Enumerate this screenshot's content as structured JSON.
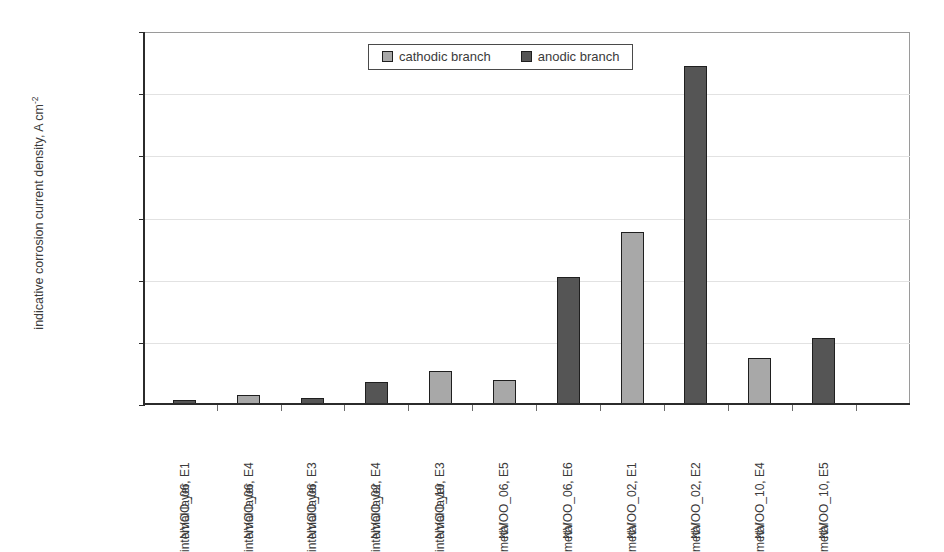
{
  "top_remnant": "clipped caption text above figure",
  "chart_data": {
    "type": "bar",
    "title": "",
    "xlabel": "",
    "ylabel": "indicative corrosion current density, A cm",
    "ylabel_exponent": "-2",
    "ylim": [
      0,
      0.00012
    ],
    "ytick_labels": [
      "1.2E-04",
      "1.0E-04",
      "8.0E-05",
      "6.0E-05",
      "4.0E-05",
      "2.0E-05",
      "0.0E+00"
    ],
    "ytick_values": [
      0.00012,
      0.0001,
      8e-05,
      6e-05,
      4e-05,
      2e-05,
      0
    ],
    "grid": true,
    "legend_position": "top-center",
    "legend": [
      {
        "name": "cathodic branch",
        "color": "#a8a8a8"
      },
      {
        "name": "anodic branch",
        "color": "#555555"
      }
    ],
    "categories": [
      {
        "line1": "NVOO_06, E1",
        "line2": "internal layer"
      },
      {
        "line1": "NVOO_06, E4",
        "line2": "internal layer"
      },
      {
        "line1": "NVOO_06, E3",
        "line2": "internal layer"
      },
      {
        "line1": "NVOO_02, E4",
        "line2": "internal layer"
      },
      {
        "line1": "NVOO_10, E3",
        "line2": "internal layer"
      },
      {
        "line1": "NVOO_06, E5",
        "line2": "metal"
      },
      {
        "line1": "NVOO_06, E6",
        "line2": "metal"
      },
      {
        "line1": "NVOO_02, E1",
        "line2": "metal"
      },
      {
        "line1": "NVOO_02, E2",
        "line2": "metal"
      },
      {
        "line1": "NVOO_10, E4",
        "line2": "metal"
      },
      {
        "line1": "NVOO_10, E5",
        "line2": "metal"
      }
    ],
    "points": [
      {
        "category": "NVOO_06, E1 internal layer",
        "series": "anodic branch",
        "value": 1.5e-06,
        "color": "#555555"
      },
      {
        "category": "NVOO_06, E4 internal layer",
        "series": "cathodic branch",
        "value": 3.1e-06,
        "color": "#a8a8a8"
      },
      {
        "category": "NVOO_06, E3 internal layer",
        "series": "anodic branch",
        "value": 2.3e-06,
        "color": "#555555"
      },
      {
        "category": "NVOO_02, E4 internal layer",
        "series": "anodic branch",
        "value": 7.3e-06,
        "color": "#555555"
      },
      {
        "category": "NVOO_10, E3 internal layer",
        "series": "cathodic branch",
        "value": 1.1e-05,
        "color": "#a8a8a8"
      },
      {
        "category": "NVOO_06, E5 metal",
        "series": "cathodic branch",
        "value": 8.1e-06,
        "color": "#a8a8a8"
      },
      {
        "category": "NVOO_06, E6 metal",
        "series": "anodic branch",
        "value": 4.12e-05,
        "color": "#555555"
      },
      {
        "category": "NVOO_02, E1 metal",
        "series": "cathodic branch",
        "value": 5.57e-05,
        "color": "#a8a8a8"
      },
      {
        "category": "NVOO_02, E2 metal",
        "series": "anodic branch",
        "value": 0.000109,
        "color": "#555555"
      },
      {
        "category": "NVOO_10, E4 metal",
        "series": "cathodic branch",
        "value": 1.51e-05,
        "color": "#a8a8a8"
      },
      {
        "category": "NVOO_10, E5 metal",
        "series": "anodic branch",
        "value": 2.15e-05,
        "color": "#555555"
      }
    ]
  }
}
